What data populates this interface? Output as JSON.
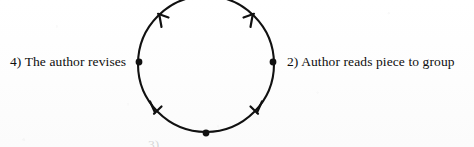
{
  "figure": {
    "kind": "cycle-diagram",
    "ink_color": "#111111",
    "background_color": "#fefefe",
    "direction": "clockwise",
    "circle": {
      "cx": 206,
      "cy": 64,
      "r": 68,
      "stroke_width": 2.1,
      "top_clipped": true
    },
    "nodes": [
      {
        "id": "node-right",
        "x": 273,
        "y": 62,
        "dot_r": 3.4
      },
      {
        "id": "node-bottom",
        "x": 206,
        "y": 133,
        "dot_r": 3.4
      },
      {
        "id": "node-left",
        "x": 139,
        "y": 62,
        "dot_r": 3.4
      }
    ],
    "arrowheads": [
      {
        "id": "arrow-top-right",
        "angle_deg": -52,
        "points": "clockwise"
      },
      {
        "id": "arrow-bottom-right",
        "angle_deg": 48,
        "points": "clockwise"
      },
      {
        "id": "arrow-bottom-left",
        "angle_deg": 132,
        "points": "clockwise"
      },
      {
        "id": "arrow-top-left",
        "angle_deg": 228,
        "points": "clockwise"
      }
    ]
  },
  "labels": {
    "left": "4) The author revises",
    "right": "2) Author reads piece to group",
    "bottom_clipped": "3)"
  }
}
